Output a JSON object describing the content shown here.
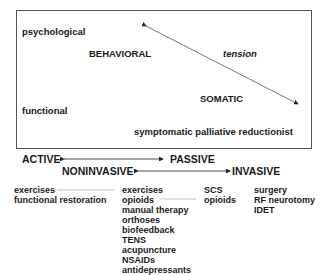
{
  "box": {
    "psychological": "psychological",
    "behavioral": "BEHAVIORAL",
    "tension": "tension",
    "somatic": "SOMATIC",
    "functional": "functional",
    "symptomatic": "symptomatic palliative reductionist"
  },
  "axes": {
    "active": "ACTIVE",
    "passive": "PASSIVE",
    "noninvasive": "NONINVASIVE",
    "invasive": "INVASIVE"
  },
  "columns": [
    {
      "items": [
        "exercises",
        "functional restoration"
      ]
    },
    {
      "items": [
        "exercises",
        "opioids",
        "manual therapy",
        "orthoses",
        "biofeedback",
        "TENS",
        "acupuncture",
        "NSAIDs",
        "antidepressants"
      ]
    },
    {
      "items": [
        "SCS",
        "opioids"
      ]
    },
    {
      "items": [
        "surgery",
        "RF neurotomy",
        "IDET"
      ]
    }
  ]
}
